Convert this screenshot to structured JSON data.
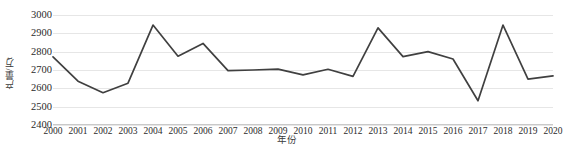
{
  "chart_data": {
    "type": "line",
    "title": "",
    "xlabel": "年份",
    "ylabel": "产量/万t",
    "ylim": [
      2400,
      3000
    ],
    "yticks": [
      3000,
      2900,
      2800,
      2700,
      2600,
      2500,
      2400
    ],
    "grid": true,
    "legend": null,
    "series_color": "#404040",
    "grid_color": "#e6e6e6",
    "categories": [
      "2000",
      "2001",
      "2002",
      "2003",
      "2004",
      "2005",
      "2006",
      "2007",
      "2008",
      "2009",
      "2010",
      "2011",
      "2012",
      "2013",
      "2014",
      "2015",
      "2016",
      "2017",
      "2018",
      "2019",
      "2020"
    ],
    "values": [
      2772,
      2639,
      2576,
      2628,
      2945,
      2775,
      2845,
      2697,
      2700,
      2705,
      2673,
      2704,
      2665,
      2930,
      2773,
      2800,
      2760,
      2532,
      2945,
      2650,
      2668
    ],
    "series": [
      {
        "name": "产量",
        "values": [
          2772,
          2639,
          2576,
          2628,
          2945,
          2775,
          2845,
          2697,
          2700,
          2705,
          2673,
          2704,
          2665,
          2930,
          2773,
          2800,
          2760,
          2532,
          2945,
          2650,
          2668
        ]
      }
    ]
  }
}
